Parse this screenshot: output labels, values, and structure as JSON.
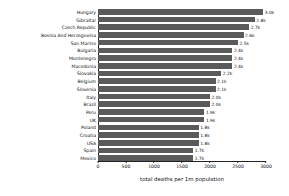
{
  "chart_data": {
    "type": "bar",
    "orientation": "horizontal",
    "title": "",
    "xlabel": "total deaths per 1m population",
    "ylabel": "",
    "xlim": [
      0,
      3000
    ],
    "xticks": [
      0,
      500,
      1000,
      1500,
      2000,
      2500,
      3000
    ],
    "xticklabels": [
      "0",
      "500",
      "1000",
      "1500",
      "2000",
      "2500",
      "3000"
    ],
    "grid": false,
    "legend": "none",
    "bar_color": "#5a5a5a",
    "categories": [
      "Hungary",
      "Gibraltar",
      "Czech Republic",
      "Bosnia And Herzegovina",
      "San Marino",
      "Bulgaria",
      "Montenegro",
      "Macedonia",
      "Slovakia",
      "Belgium",
      "Slovenia",
      "Italy",
      "Brazil",
      "Peru",
      "UK",
      "Poland",
      "Croatia",
      "USA",
      "Spain",
      "Mexico"
    ],
    "values": [
      2950,
      2800,
      2700,
      2600,
      2500,
      2400,
      2400,
      2400,
      2200,
      2100,
      2100,
      2000,
      2000,
      1900,
      1900,
      1800,
      1800,
      1800,
      1700,
      1700
    ],
    "data_labels": [
      "3.0k",
      "2.8k",
      "2.7k",
      "2.6k",
      "2.5k",
      "2.4k",
      "2.4k",
      "2.4k",
      "2.2k",
      "2.1k",
      "2.1k",
      "2.0k",
      "2.0k",
      "1.9k",
      "1.9k",
      "1.8k",
      "1.8k",
      "1.8k",
      "1.7k",
      "1.7k"
    ]
  }
}
